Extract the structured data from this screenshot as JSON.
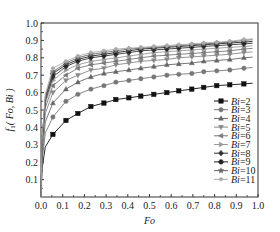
{
  "chart_data": {
    "type": "line",
    "title": "",
    "xlabel": "Fo",
    "ylabel": "f1(Fo, Bi)",
    "xlim": [
      0.0,
      1.0
    ],
    "ylim": [
      0.0,
      1.0
    ],
    "xticks": [
      "0.0",
      "0.1",
      "0.2",
      "0.3",
      "0.4",
      "0.5",
      "0.6",
      "0.7",
      "0.8",
      "0.9",
      "1.0"
    ],
    "yticks": [
      "0.1",
      "0.2",
      "0.3",
      "0.4",
      "0.5",
      "0.6",
      "0.7",
      "0.8",
      "0.9",
      "1.0"
    ],
    "grid": false,
    "legend_position": "lower right",
    "x": [
      0.055,
      0.115,
      0.17,
      0.23,
      0.29,
      0.345,
      0.405,
      0.46,
      0.52,
      0.58,
      0.635,
      0.695,
      0.75,
      0.81,
      0.87,
      0.935
    ],
    "series": [
      {
        "name": "Bi=2",
        "marker": "square",
        "color": "#111111",
        "values": [
          0.36,
          0.44,
          0.48,
          0.52,
          0.54,
          0.56,
          0.57,
          0.58,
          0.59,
          0.6,
          0.61,
          0.62,
          0.63,
          0.64,
          0.645,
          0.65
        ]
      },
      {
        "name": "Bi=3",
        "marker": "circle",
        "color": "#777777",
        "values": [
          0.46,
          0.55,
          0.59,
          0.62,
          0.64,
          0.66,
          0.67,
          0.68,
          0.69,
          0.7,
          0.705,
          0.71,
          0.72,
          0.725,
          0.73,
          0.74
        ]
      },
      {
        "name": "Bi=4",
        "marker": "triangle-up",
        "color": "#666666",
        "values": [
          0.54,
          0.62,
          0.66,
          0.69,
          0.71,
          0.72,
          0.73,
          0.74,
          0.75,
          0.76,
          0.765,
          0.77,
          0.78,
          0.785,
          0.79,
          0.8
        ]
      },
      {
        "name": "Bi=5",
        "marker": "triangle-down",
        "color": "#888888",
        "values": [
          0.6,
          0.67,
          0.7,
          0.73,
          0.74,
          0.76,
          0.77,
          0.78,
          0.785,
          0.79,
          0.8,
          0.805,
          0.81,
          0.815,
          0.82,
          0.83
        ]
      },
      {
        "name": "Bi=6",
        "marker": "triangle-left",
        "color": "#777777",
        "values": [
          0.64,
          0.7,
          0.74,
          0.76,
          0.77,
          0.78,
          0.79,
          0.8,
          0.81,
          0.815,
          0.82,
          0.825,
          0.83,
          0.835,
          0.84,
          0.85
        ]
      },
      {
        "name": "Bi=7",
        "marker": "triangle-right",
        "color": "#999999",
        "values": [
          0.67,
          0.73,
          0.76,
          0.78,
          0.79,
          0.8,
          0.81,
          0.82,
          0.83,
          0.835,
          0.84,
          0.845,
          0.85,
          0.855,
          0.86,
          0.865
        ]
      },
      {
        "name": "Bi=8",
        "marker": "diamond",
        "color": "#333333",
        "values": [
          0.69,
          0.75,
          0.78,
          0.8,
          0.81,
          0.82,
          0.83,
          0.84,
          0.845,
          0.85,
          0.855,
          0.86,
          0.865,
          0.87,
          0.875,
          0.88
        ]
      },
      {
        "name": "Bi=9",
        "marker": "hexagon",
        "color": "#222222",
        "values": [
          0.71,
          0.76,
          0.79,
          0.81,
          0.82,
          0.83,
          0.84,
          0.85,
          0.855,
          0.86,
          0.865,
          0.87,
          0.875,
          0.88,
          0.885,
          0.89
        ]
      },
      {
        "name": "Bi=10",
        "marker": "star",
        "color": "#666666",
        "values": [
          0.72,
          0.77,
          0.8,
          0.82,
          0.83,
          0.84,
          0.85,
          0.855,
          0.86,
          0.865,
          0.87,
          0.875,
          0.88,
          0.885,
          0.89,
          0.9
        ]
      },
      {
        "name": "Bi=11",
        "marker": "plus",
        "color": "#aaaaaa",
        "values": [
          0.74,
          0.78,
          0.81,
          0.83,
          0.84,
          0.85,
          0.855,
          0.86,
          0.865,
          0.87,
          0.875,
          0.88,
          0.885,
          0.89,
          0.895,
          0.905
        ]
      }
    ]
  },
  "axes": {
    "x_label": "Fo",
    "y_label_f": "f",
    "y_label_sub": "1",
    "y_label_args": "( Fo, Bi )"
  },
  "legend": {
    "items": [
      {
        "prefix": "Bi",
        "value": "=2"
      },
      {
        "prefix": "Bi",
        "value": "=3"
      },
      {
        "prefix": "Bi",
        "value": "=4"
      },
      {
        "prefix": "Bi",
        "value": "=5"
      },
      {
        "prefix": "Bi",
        "value": "=6"
      },
      {
        "prefix": "Bi",
        "value": "=7"
      },
      {
        "prefix": "Bi",
        "value": "=8"
      },
      {
        "prefix": "Bi",
        "value": "=9"
      },
      {
        "prefix": "Bi",
        "value": "=10"
      },
      {
        "prefix": "Bi",
        "value": "=11"
      }
    ]
  }
}
